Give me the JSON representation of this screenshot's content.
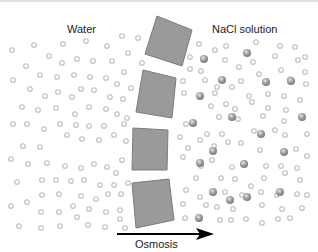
{
  "diagram": {
    "left_label": "Water",
    "right_label": "NaCl solution",
    "arrow_label": "Osmosis",
    "colors": {
      "membrane_fill": "#9a9a9a",
      "membrane_stroke": "#7a7a7a",
      "water_molecule": "#b8b8b8",
      "ion": "#8c8c8c",
      "arrow": "#000000"
    },
    "membrane_segments": 4
  }
}
